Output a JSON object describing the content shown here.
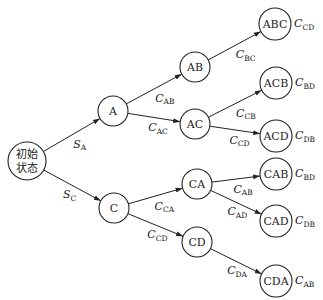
{
  "diagram": {
    "type": "tree",
    "nodes": [
      {
        "id": "root",
        "label_line1": "初始",
        "label_line2": "状态",
        "x": 27,
        "y": 161,
        "r": 19
      },
      {
        "id": "A",
        "label": "A",
        "x": 113,
        "y": 111,
        "r": 15
      },
      {
        "id": "C",
        "label": "C",
        "x": 114,
        "y": 208,
        "r": 15
      },
      {
        "id": "AB",
        "label": "AB",
        "x": 195,
        "y": 67,
        "r": 15
      },
      {
        "id": "AC",
        "label": "AC",
        "x": 195,
        "y": 124,
        "r": 15
      },
      {
        "id": "CA",
        "label": "CA",
        "x": 197,
        "y": 184,
        "r": 15
      },
      {
        "id": "CD",
        "label": "CD",
        "x": 197,
        "y": 242,
        "r": 15
      },
      {
        "id": "ABC",
        "label": "ABC",
        "x": 275,
        "y": 24,
        "r": 16
      },
      {
        "id": "ACB",
        "label": "ACB",
        "x": 276,
        "y": 83,
        "r": 16
      },
      {
        "id": "ACD",
        "label": "ACD",
        "x": 276,
        "y": 136,
        "r": 16
      },
      {
        "id": "CAB",
        "label": "CAB",
        "x": 276,
        "y": 174,
        "r": 16
      },
      {
        "id": "CAD",
        "label": "CAD",
        "x": 276,
        "y": 221,
        "r": 16
      },
      {
        "id": "CDA",
        "label": "CDA",
        "x": 276,
        "y": 281,
        "r": 16
      }
    ],
    "edges": [
      {
        "from": "root",
        "to": "A",
        "main": "S",
        "sub": "A"
      },
      {
        "from": "root",
        "to": "C",
        "main": "S",
        "sub": "C"
      },
      {
        "from": "A",
        "to": "AB",
        "main": "C",
        "sub": "AB"
      },
      {
        "from": "A",
        "to": "AC",
        "main": "C",
        "sub": "AC"
      },
      {
        "from": "C",
        "to": "CA",
        "main": "C",
        "sub": "CA"
      },
      {
        "from": "C",
        "to": "CD",
        "main": "C",
        "sub": "CD"
      },
      {
        "from": "AB",
        "to": "ABC",
        "main": "C",
        "sub": "BC"
      },
      {
        "from": "AC",
        "to": "ACB",
        "main": "C",
        "sub": "CB"
      },
      {
        "from": "AC",
        "to": "ACD",
        "main": "C",
        "sub": "CD"
      },
      {
        "from": "CA",
        "to": "CAB",
        "main": "C",
        "sub": "AB"
      },
      {
        "from": "CA",
        "to": "CAD",
        "main": "C",
        "sub": "AD"
      },
      {
        "from": "CD",
        "to": "CDA",
        "main": "C",
        "sub": "DA"
      }
    ],
    "leaf_costs": [
      {
        "node": "ABC",
        "main": "C",
        "sub": "CD"
      },
      {
        "node": "ACB",
        "main": "C",
        "sub": "BD"
      },
      {
        "node": "ACD",
        "main": "C",
        "sub": "DB"
      },
      {
        "node": "CAB",
        "main": "C",
        "sub": "BD"
      },
      {
        "node": "CAD",
        "main": "C",
        "sub": "DB"
      },
      {
        "node": "CDA",
        "main": "C",
        "sub": "AB"
      }
    ]
  }
}
